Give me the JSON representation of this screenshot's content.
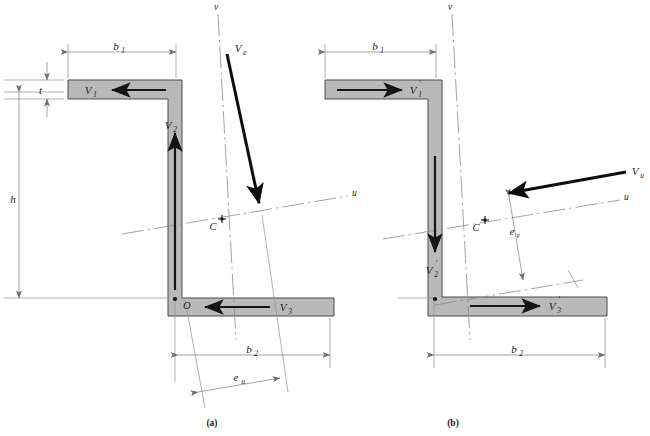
{
  "figure": {
    "background_color": "#ffffff",
    "section_fill_color": "#b9b9b9",
    "section_edge_color": "#4a4a4a",
    "arrow_color": "#141414",
    "axis_color": "#8a8a8a"
  },
  "panels": [
    {
      "id": "a",
      "caption": "(a)",
      "dimensions": [
        {
          "name": "b1",
          "label": "b",
          "sub": "1",
          "position": "top"
        },
        {
          "name": "b2",
          "label": "b",
          "sub": "2",
          "position": "bottom"
        },
        {
          "name": "h",
          "label": "h",
          "sub": "",
          "position": "left"
        },
        {
          "name": "t",
          "label": "t",
          "sub": "",
          "position": "left-top"
        },
        {
          "name": "eu",
          "label": "e",
          "sub": "u",
          "position": "bottom-oblique"
        }
      ],
      "axes": [
        {
          "name": "u-axis",
          "label": "u"
        },
        {
          "name": "v-axis",
          "label": "v"
        }
      ],
      "points": [
        {
          "name": "centroid",
          "label": "C"
        },
        {
          "name": "origin",
          "label": "O"
        }
      ],
      "forces": [
        {
          "name": "V1",
          "label": "V",
          "sub": "1",
          "direction": "left"
        },
        {
          "name": "V2",
          "label": "V",
          "sub": "2",
          "direction": "up"
        },
        {
          "name": "V3",
          "label": "V",
          "sub": "3",
          "direction": "left"
        },
        {
          "name": "Ve",
          "label": "V",
          "sub": "e",
          "direction": "down-right"
        }
      ]
    },
    {
      "id": "b",
      "caption": "(b)",
      "dimensions": [
        {
          "name": "b1",
          "label": "b",
          "sub": "1",
          "position": "top"
        },
        {
          "name": "b2",
          "label": "b",
          "sub": "2",
          "position": "bottom"
        },
        {
          "name": "ev",
          "label": "e",
          "sub": "v",
          "position": "right-oblique"
        }
      ],
      "axes": [
        {
          "name": "u-axis",
          "label": "u"
        },
        {
          "name": "v-axis",
          "label": "v"
        }
      ],
      "points": [
        {
          "name": "centroid",
          "label": "C"
        }
      ],
      "forces": [
        {
          "name": "V1prime",
          "label": "V",
          "sub": "1",
          "prime": "′",
          "direction": "right"
        },
        {
          "name": "V2prime",
          "label": "V",
          "sub": "2",
          "prime": "′",
          "direction": "down"
        },
        {
          "name": "V3prime",
          "label": "V",
          "sub": "3",
          "prime": "′",
          "direction": "right"
        },
        {
          "name": "Vu",
          "label": "V",
          "sub": "u",
          "direction": "left-up"
        }
      ]
    }
  ],
  "labels": {
    "b1_a": "b",
    "b1_a_sub": "1",
    "b2_a": "b",
    "b2_a_sub": "2",
    "h_a": "h",
    "t_a": "t",
    "eu_a": "e",
    "eu_a_sub": "u",
    "u_a": "u",
    "v_a": "v",
    "C_a": "C",
    "O_a": "O",
    "V1_a": "V",
    "V1_a_sub": "1",
    "V2_a": "V",
    "V2_a_sub": "2",
    "V3_a": "V",
    "V3_a_sub": "3",
    "Ve_a": "V",
    "Ve_a_sub": "e",
    "caption_a": "(a)",
    "b1_b": "b",
    "b1_b_sub": "1",
    "b2_b": "b",
    "b2_b_sub": "2",
    "ev_b": "e",
    "ev_b_sub": "v",
    "u_b": "u",
    "v_b": "v",
    "C_b": "C",
    "V1_b": "V",
    "V1_b_sub": "1",
    "V1_b_prime": "′",
    "V2_b": "V",
    "V2_b_sub": "2",
    "V2_b_prime": "′",
    "V3_b": "V",
    "V3_b_sub": "3",
    "V3_b_prime": "′",
    "Vu_b": "V",
    "Vu_b_sub": "u",
    "caption_b": "(b)"
  }
}
